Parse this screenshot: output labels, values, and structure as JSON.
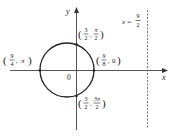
{
  "diagram": {
    "title": "",
    "type": "polar-curve-graph",
    "axes": {
      "x_label": "x",
      "y_label": "y",
      "origin_label": "0"
    },
    "curve": {
      "shape": "circle",
      "points": [
        {
          "r": "9/4",
          "theta": "π",
          "num_r": "9",
          "den_r": "4",
          "theta_num": "π",
          "theta_den": ""
        },
        {
          "r": "3/2",
          "theta": "π/2",
          "num_r": "3",
          "den_r": "2",
          "theta_num": "π",
          "theta_den": "2"
        },
        {
          "r": "9/8",
          "theta": "0",
          "num_r": "9",
          "den_r": "8",
          "theta_num": "0",
          "theta_den": ""
        },
        {
          "r": "3/2",
          "theta": "3π/2",
          "num_r": "3",
          "den_r": "2",
          "theta_num": "3π",
          "theta_den": "2"
        }
      ]
    },
    "directrix": {
      "label_lhs": "x =",
      "label_num": "9",
      "label_den": "2",
      "style": "dashed"
    },
    "colors": {
      "line": "#222222",
      "axis": "#555555",
      "dashed": "#777777",
      "background": "#ffffff"
    }
  }
}
